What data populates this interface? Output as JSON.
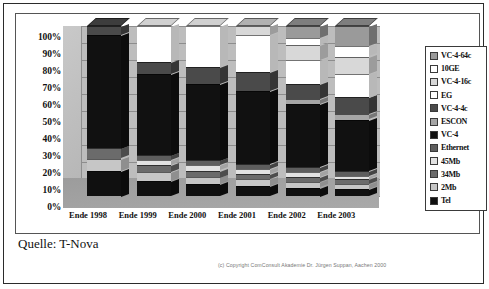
{
  "source_note": "Quelle: T-Nova",
  "copyright": "(c) Copyright ComConsult Akademie Dr. Jürgen Suppan, Aachen 2000",
  "chart_data": {
    "type": "bar",
    "stacked": true,
    "normalized_percent": true,
    "title": "",
    "xlabel": "",
    "ylabel": "",
    "ylim": [
      0,
      100
    ],
    "grid": true,
    "legend_position": "right",
    "categories": [
      "Ende 1998",
      "Ende 1999",
      "Ende 2000",
      "Ende 2001",
      "Ende 2002",
      "Ende 2003"
    ],
    "ytick_labels": [
      "100%",
      "90%",
      "80%",
      "70%",
      "60%",
      "50%",
      "40%",
      "30%",
      "20%",
      "10%",
      "0%"
    ],
    "ytick_values": [
      100,
      90,
      80,
      70,
      60,
      50,
      40,
      30,
      20,
      10,
      0
    ],
    "legend": [
      {
        "label": "VC-4-64c",
        "color": "#9a9a9a"
      },
      {
        "label": "10GE",
        "color": "#ffffff"
      },
      {
        "label": "VC-4-16c",
        "color": "#d8d8d8"
      },
      {
        "label": "EG",
        "color": "#ffffff"
      },
      {
        "label": "VC-4-4c",
        "color": "#4a4a4a"
      },
      {
        "label": "ESCON",
        "color": "#a6a6a6"
      },
      {
        "label": "VC-4",
        "color": "#111111"
      },
      {
        "label": "Ethernet",
        "color": "#5e5e5e"
      },
      {
        "label": "45Mb",
        "color": "#e2e2e2"
      },
      {
        "label": "34Mb",
        "color": "#6b6b6b"
      },
      {
        "label": "2Mb",
        "color": "#c6c6c6"
      },
      {
        "label": "Tel",
        "color": "#101010"
      }
    ],
    "series": [
      {
        "name": "Tel",
        "color": "#101010",
        "values": [
          15,
          9,
          7,
          6,
          5,
          4
        ]
      },
      {
        "name": "2Mb",
        "color": "#c6c6c6",
        "values": [
          7,
          5,
          4,
          4,
          3,
          3
        ]
      },
      {
        "name": "34Mb",
        "color": "#6b6b6b",
        "values": [
          6,
          4,
          4,
          3,
          3,
          3
        ]
      },
      {
        "name": "45Mb",
        "color": "#e2e2e2",
        "values": [
          0,
          3,
          3,
          3,
          3,
          2
        ]
      },
      {
        "name": "Ethernet",
        "color": "#5e5e5e",
        "values": [
          0,
          3,
          3,
          3,
          3,
          3
        ]
      },
      {
        "name": "VC-4",
        "color": "#111111",
        "values": [
          67,
          48,
          45,
          43,
          37,
          30
        ]
      },
      {
        "name": "ESCON",
        "color": "#a6a6a6",
        "values": [
          0,
          0,
          0,
          0,
          3,
          3
        ]
      },
      {
        "name": "VC-4-4c",
        "color": "#4a4a4a",
        "values": [
          5,
          7,
          10,
          11,
          9,
          10
        ]
      },
      {
        "name": "EG",
        "color": "#ffffff",
        "values": [
          0,
          21,
          24,
          22,
          14,
          14
        ]
      },
      {
        "name": "VC-4-16c",
        "color": "#d8d8d8",
        "values": [
          0,
          0,
          0,
          5,
          9,
          10
        ]
      },
      {
        "name": "10GE",
        "color": "#ffffff",
        "values": [
          0,
          0,
          0,
          0,
          4,
          6
        ]
      },
      {
        "name": "VC-4-64c",
        "color": "#9a9a9a",
        "values": [
          0,
          0,
          0,
          0,
          7,
          12
        ]
      }
    ]
  }
}
